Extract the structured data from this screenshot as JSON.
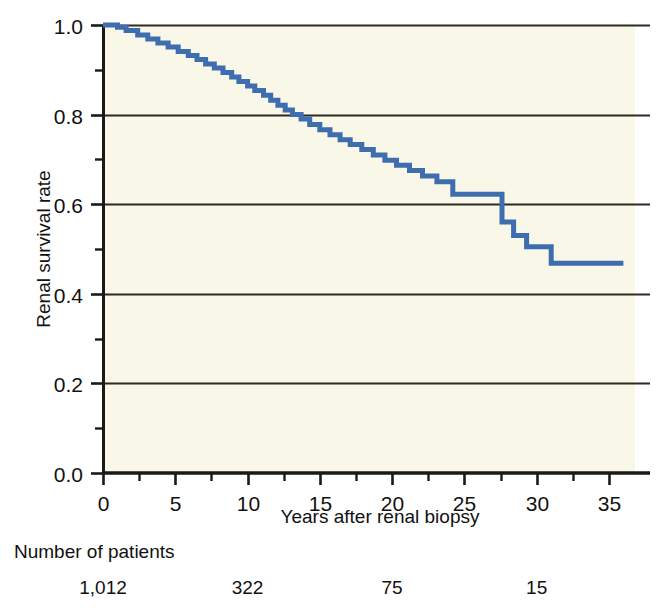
{
  "chart_data": {
    "type": "line",
    "subtype": "kaplan-meier-step",
    "title": "",
    "xlabel": "Years after renal biopsy",
    "ylabel": "Renal survival rate",
    "xlim": [
      0,
      36.8
    ],
    "ylim": [
      0.0,
      1.0
    ],
    "xticks": [
      0,
      5,
      10,
      15,
      20,
      25,
      30,
      35
    ],
    "xtick_labels": [
      "0",
      "5",
      "10",
      "15",
      "20",
      "25",
      "30",
      "35"
    ],
    "yticks": [
      0.0,
      0.2,
      0.4,
      0.6,
      0.8,
      1.0
    ],
    "ytick_labels": [
      "0.0",
      "0.2",
      "0.4",
      "0.6",
      "0.8",
      "1.0"
    ],
    "yminor_ticks": [
      0.1,
      0.3,
      0.5,
      0.7,
      0.9
    ],
    "grid": "horizontal",
    "legend": "none",
    "series": [
      {
        "name": "Renal survival",
        "color": "#3E6DB0",
        "x": [
          0,
          1.0,
          1.6,
          2.4,
          3.1,
          3.8,
          4.5,
          5.2,
          5.9,
          6.5,
          7.1,
          7.7,
          8.3,
          8.9,
          9.4,
          10.0,
          10.5,
          11.1,
          11.6,
          12.1,
          12.6,
          13.1,
          13.7,
          14.3,
          15.0,
          15.7,
          16.4,
          17.1,
          17.9,
          18.7,
          19.5,
          20.3,
          21.2,
          22.1,
          23.1,
          24.2,
          26.9,
          27.6,
          28.4,
          29.3,
          31.0,
          36.0
        ],
        "y": [
          1.0,
          0.995,
          0.988,
          0.978,
          0.969,
          0.96,
          0.951,
          0.941,
          0.932,
          0.923,
          0.913,
          0.904,
          0.894,
          0.884,
          0.874,
          0.864,
          0.854,
          0.843,
          0.832,
          0.821,
          0.81,
          0.8,
          0.79,
          0.778,
          0.766,
          0.755,
          0.744,
          0.733,
          0.722,
          0.71,
          0.698,
          0.687,
          0.675,
          0.663,
          0.65,
          0.622,
          0.622,
          0.56,
          0.53,
          0.505,
          0.468,
          0.468
        ]
      }
    ],
    "risk_table": {
      "title": "Number of patients",
      "x_positions": [
        0,
        10,
        20,
        30
      ],
      "values": [
        "1,012",
        "322",
        "75",
        "15"
      ]
    },
    "colors": {
      "line": "#3E6DB0",
      "axis": "#1a1a17",
      "grid": "#2b2b24",
      "plot_background": "#F9F7E8",
      "page_background": "#ffffff",
      "text": "#111111"
    }
  }
}
